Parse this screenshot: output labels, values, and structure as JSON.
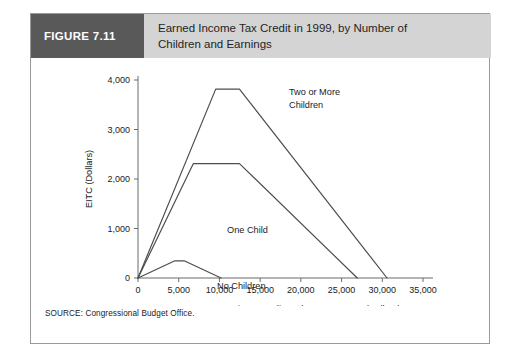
{
  "figure": {
    "number_label": "FIGURE 7.11",
    "title_line_1": "Earned Income Tax Credit in 1999, by Number of",
    "title_line_2": "Children and Earnings",
    "source": "SOURCE: Congressional Budget Office.",
    "colors": {
      "number_block_bg": "#595959",
      "number_block_text": "#ffffff",
      "title_block_bg": "#d4d4d4",
      "border": "#9a9a9a",
      "line": "#4d4d4d",
      "axis": "#6b6b6b",
      "text": "#1a1a1a"
    }
  },
  "chart_data": {
    "type": "line",
    "title": "Earned Income Tax Credit in 1999, by Number of Children and Earnings",
    "xlabel": "Taxpayer's Earnings or Adjusted Gross Income (Dollars)",
    "ylabel": "EITC (Dollars)",
    "xlim": [
      0,
      35000
    ],
    "ylim": [
      0,
      4000
    ],
    "xticks": [
      0,
      5000,
      10000,
      15000,
      20000,
      25000,
      30000,
      35000
    ],
    "xtick_labels": [
      "0",
      "5,000",
      "10,000",
      "15,000",
      "20,000",
      "25,000",
      "30,000",
      "35,000"
    ],
    "yticks": [
      0,
      1000,
      2000,
      3000,
      4000
    ],
    "ytick_labels": [
      "0",
      "1,000",
      "2,000",
      "3,000",
      "4,000"
    ],
    "grid": false,
    "legend_position": "inline-annotations",
    "series": [
      {
        "name": "Two or More Children",
        "annotation_line_1": "Two or More",
        "annotation_line_2": "Children",
        "x": [
          0,
          9540,
          12460,
          30580
        ],
        "values": [
          0,
          3816,
          3816,
          0
        ]
      },
      {
        "name": "One Child",
        "annotation_line_1": "One Child",
        "annotation_line_2": "",
        "x": [
          0,
          6800,
          12460,
          26928
        ],
        "values": [
          0,
          2312,
          2312,
          0
        ]
      },
      {
        "name": "No Children",
        "annotation_line_1": "No Children",
        "annotation_line_2": "",
        "x": [
          0,
          4530,
          5670,
          10200
        ],
        "values": [
          0,
          347,
          347,
          0
        ]
      }
    ]
  }
}
